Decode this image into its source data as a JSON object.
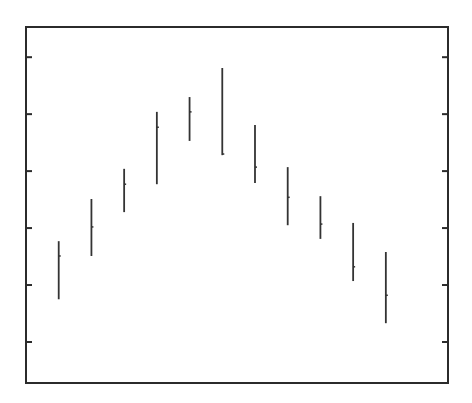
{
  "chart_data": {
    "type": "high-low",
    "title": "",
    "xlabel": "",
    "ylabel": "",
    "x": [
      1,
      2,
      3,
      4,
      5,
      6,
      7,
      8,
      9,
      10,
      11
    ],
    "series": [
      {
        "name": "high",
        "values": [
          2.77,
          3.51,
          4.04,
          5.04,
          5.3,
          5.81,
          4.81,
          4.07,
          3.56,
          3.09,
          2.58
        ]
      },
      {
        "name": "low",
        "values": [
          1.75,
          2.51,
          3.28,
          3.77,
          4.53,
          4.28,
          3.79,
          3.05,
          2.81,
          2.07,
          1.33
        ]
      },
      {
        "name": "mid",
        "values": [
          2.51,
          3.02,
          3.77,
          4.77,
          5.04,
          4.3,
          4.07,
          3.54,
          3.07,
          2.32,
          1.82
        ]
      }
    ],
    "ylim": [
      0.28,
      6.53
    ],
    "xlim": [
      0,
      12.9
    ],
    "yticks": [
      1,
      2,
      3,
      4,
      5,
      6
    ],
    "ytick_labels": [],
    "xticks": [],
    "grid": false,
    "legend": null
  },
  "style": {
    "frame_color": "#2b2b2b",
    "bar_color": "#333333",
    "background": "#ffffff"
  }
}
